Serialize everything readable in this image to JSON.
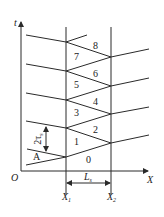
{
  "axes": {
    "y_label": "t",
    "x_label": "X",
    "origin_label": "O"
  },
  "positions": {
    "x1_label": "X",
    "x1_sub": "1",
    "x2_label": "X",
    "x2_sub": "2",
    "length_label": "L",
    "length_sub": "s"
  },
  "regions": [
    "0",
    "1",
    "2",
    "3",
    "4",
    "5",
    "6",
    "7",
    "8",
    "A"
  ],
  "interval": {
    "label": "2τ",
    "sub": "s"
  }
}
